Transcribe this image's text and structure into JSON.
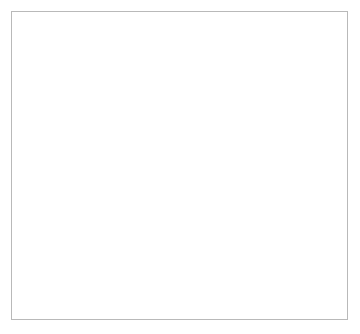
{
  "figure": {
    "background": "#ffffff",
    "frame_color": "#b9b9b9"
  },
  "chart_data": {
    "type": "line",
    "title": "",
    "subtitle": "",
    "xlabel": "",
    "ylabel": "%",
    "ylim": [
      0,
      84
    ],
    "xlim": [
      1968,
      1992
    ],
    "grid": false,
    "legend_position": "inside-right-center",
    "y_ticks": [
      0,
      20,
      40,
      60,
      80
    ],
    "y_ticklabels": [
      "0",
      "20",
      "40",
      "60",
      "80"
    ],
    "x_ticks": [
      1968,
      1969,
      1970,
      1971,
      1972,
      1973,
      1974,
      1975,
      1976,
      1977,
      1978,
      1979,
      1980,
      1981,
      1982,
      1983,
      1984,
      1985,
      1986,
      1987,
      1988,
      1989,
      1990,
      1991,
      1992
    ],
    "x_ticklabels_shown": [
      "1970",
      "1975",
      "1980",
      "1985",
      "1990"
    ],
    "x_ticklabel_values": [
      1970,
      1975,
      1980,
      1985,
      1990
    ],
    "x": [
      1968,
      1969,
      1970,
      1971,
      1972,
      1973,
      1974,
      1975,
      1976,
      1977,
      1978,
      1979,
      1980,
      1981,
      1982,
      1983,
      1984,
      1985,
      1986,
      1987,
      1988,
      1989,
      1990,
      1991,
      1992
    ],
    "series": [
      {
        "name": "Aid/DE",
        "color": "#1a1a1a",
        "linewidth": 2.1,
        "values": [
          73.5,
          76.5,
          71.0,
          68.5,
          52.0,
          44.5,
          24.2,
          33.0,
          37.5,
          36.0,
          40.0,
          34.5,
          27.5,
          24.8,
          25.0,
          38.5,
          33.5,
          32.5,
          68.0,
          64.5,
          81.0,
          62.0,
          50.5,
          47.0,
          44.0
        ]
      },
      {
        "name": "DE/TE",
        "color": "#c3c3c3",
        "linewidth": 1.9,
        "values": [
          20.0,
          27.0,
          34.5,
          36.0,
          36.5,
          39.5,
          39.0,
          48.0,
          50.5,
          55.5,
          49.5,
          48.0,
          49.5,
          50.5,
          50.0,
          53.5,
          49.0,
          46.0,
          40.0,
          36.0,
          35.5,
          37.5,
          36.0,
          39.5,
          42.0
        ]
      }
    ],
    "legend": [
      {
        "label": "Aid/DE",
        "color": "#1a1a1a",
        "style": "thick-solid"
      },
      {
        "label": "DE/TE",
        "color": "#c3c3c3",
        "style": "thin-solid"
      }
    ]
  }
}
